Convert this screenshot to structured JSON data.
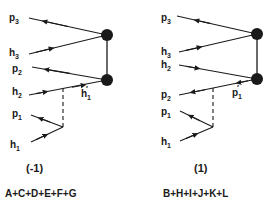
{
  "diagrams": [
    {
      "caption": "(-1)",
      "formula": "A+C+D+E+F+G",
      "labels": {
        "p3": {
          "base": "p",
          "sub": "3"
        },
        "h3": {
          "base": "h",
          "sub": "3"
        },
        "row3": {
          "base": "p",
          "sub": "2"
        },
        "row4": {
          "base": "h",
          "sub": "2"
        },
        "p1": {
          "base": "p",
          "sub": "1"
        },
        "h1": {
          "base": "h",
          "sub": "1"
        },
        "prime": {
          "base": "h",
          "sub": "1",
          "mark": "′"
        }
      }
    },
    {
      "caption": "(1)",
      "formula": "B+H+I+J+K+L",
      "labels": {
        "p3": {
          "base": "p",
          "sub": "3"
        },
        "h3": {
          "base": "h",
          "sub": "3"
        },
        "row3": {
          "base": "h",
          "sub": "2"
        },
        "row4": {
          "base": "p",
          "sub": "2"
        },
        "p1": {
          "base": "p",
          "sub": "1"
        },
        "h1": {
          "base": "h",
          "sub": "1"
        },
        "prime": {
          "base": "p",
          "sub": "1",
          "mark": "′"
        }
      }
    }
  ],
  "colors": {
    "ink": "#1a1a1a",
    "background": "#ffffff"
  }
}
